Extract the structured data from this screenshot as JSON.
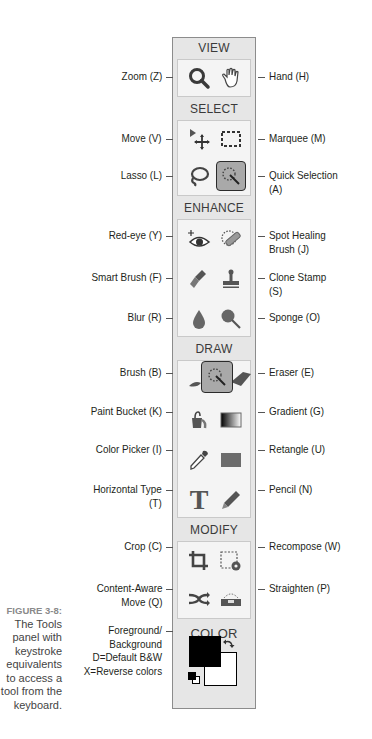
{
  "caption": {
    "figure_label": "FIGURE 3-8:",
    "text": "The Tools panel with keystroke equivalents to access a tool from the keyboard."
  },
  "panel": {
    "sections": [
      {
        "title": "VIEW"
      },
      {
        "title": "SELECT"
      },
      {
        "title": "ENHANCE"
      },
      {
        "title": "DRAW"
      },
      {
        "title": "MODIFY"
      },
      {
        "title": "COLOR"
      }
    ]
  },
  "tools": {
    "zoom": {
      "icon": "magnifier-icon",
      "label": "Zoom (Z)"
    },
    "hand": {
      "icon": "hand-icon",
      "label": "Hand (H)"
    },
    "move": {
      "icon": "move-icon",
      "label": "Move (V)"
    },
    "marquee": {
      "icon": "marquee-icon",
      "label": "Marquee (M)"
    },
    "lasso": {
      "icon": "lasso-icon",
      "label": "Lasso (L)"
    },
    "quick_selection": {
      "icon": "quick-selection-icon",
      "label_1": "Quick Selection",
      "label_2": "(A)",
      "active": true
    },
    "red_eye": {
      "icon": "eye-icon",
      "label": "Red-eye (Y)"
    },
    "spot_healing": {
      "icon": "bandage-icon",
      "label_1": "Spot Healing",
      "label_2": "Brush (J)"
    },
    "smart_brush": {
      "icon": "smart-brush-icon",
      "label": "Smart Brush (F)"
    },
    "clone_stamp": {
      "icon": "stamp-icon",
      "label_1": "Clone Stamp",
      "label_2": "(S)"
    },
    "blur": {
      "icon": "drop-icon",
      "label": "Blur (R)"
    },
    "sponge": {
      "icon": "sponge-icon",
      "label": "Sponge (O)"
    },
    "brush": {
      "icon": "brush-icon",
      "label": "Brush (B)"
    },
    "eraser": {
      "icon": "eraser-icon",
      "label": "Eraser (E)"
    },
    "paint_bucket": {
      "icon": "bucket-icon",
      "label": "Paint Bucket (K)"
    },
    "gradient": {
      "icon": "gradient-icon",
      "label": "Gradient (G)"
    },
    "color_picker": {
      "icon": "eyedropper-icon",
      "label": "Color Picker (I)"
    },
    "rectangle": {
      "icon": "rectangle-icon",
      "label": "Retangle (U)"
    },
    "horizontal_type": {
      "icon": "type-icon",
      "label_1": "Horizontal Type",
      "label_2": "(T)",
      "glyph": "T"
    },
    "pencil": {
      "icon": "pencil-icon",
      "label": "Pencil (N)"
    },
    "crop": {
      "icon": "crop-icon",
      "label": "Crop (C)"
    },
    "recompose": {
      "icon": "recompose-icon",
      "label": "Recompose (W)"
    },
    "content_aware_move": {
      "icon": "shuffle-icon",
      "label_1": "Content-Aware",
      "label_2": "Move (Q)"
    },
    "straighten": {
      "icon": "straighten-icon",
      "label": "Straighten (P)"
    },
    "color": {
      "label_lines": [
        "Foreground/",
        "Background",
        "D=Default B&W",
        "X=Reverse colors"
      ],
      "foreground": "#000000",
      "background": "#ffffff"
    }
  }
}
